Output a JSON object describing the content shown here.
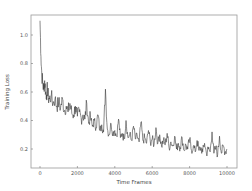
{
  "chart_data": {
    "type": "line",
    "title": "",
    "xlabel": "Time Frames",
    "ylabel": "Training Loss",
    "xlim": [
      -500,
      10500
    ],
    "ylim": [
      0.05,
      1.18
    ],
    "grid": false,
    "legend": null,
    "x_ticks": [
      0,
      2000,
      4000,
      6000,
      8000,
      10000
    ],
    "x_tick_labels": [
      "0",
      "2000",
      "4000",
      "6000",
      "8000",
      "10000"
    ],
    "y_ticks": [
      0.2,
      0.4,
      0.6,
      0.8,
      1.0
    ],
    "y_tick_labels": [
      "0.2",
      "0.4",
      "0.6",
      "0.8",
      "1.0"
    ],
    "line_color": "#3a3a3a",
    "series": [
      {
        "name": "Training Loss",
        "x": [
          0,
          50,
          100,
          150,
          200,
          250,
          300,
          350,
          400,
          450,
          500,
          600,
          700,
          800,
          900,
          1000,
          1100,
          1200,
          1300,
          1400,
          1500,
          1600,
          1700,
          1800,
          1900,
          2000,
          2100,
          2200,
          2300,
          2400,
          2500,
          2600,
          2700,
          2800,
          2900,
          3000,
          3100,
          3200,
          3300,
          3400,
          3500,
          3600,
          3700,
          3800,
          3900,
          4000,
          4100,
          4200,
          4300,
          4400,
          4500,
          4600,
          4700,
          4800,
          4900,
          5000,
          5100,
          5200,
          5300,
          5400,
          5500,
          5600,
          5700,
          5800,
          5900,
          6000,
          6100,
          6200,
          6300,
          6400,
          6500,
          6600,
          6700,
          6800,
          6900,
          7000,
          7100,
          7200,
          7300,
          7400,
          7500,
          7600,
          7700,
          7800,
          7900,
          8000,
          8100,
          8200,
          8300,
          8400,
          8500,
          8600,
          8700,
          8800,
          8900,
          9000,
          9100,
          9200,
          9300,
          9400,
          9500,
          9600,
          9700,
          9800,
          9900,
          10000
        ],
        "values": [
          1.1,
          0.85,
          0.72,
          0.66,
          0.62,
          0.68,
          0.6,
          0.58,
          0.63,
          0.56,
          0.55,
          0.57,
          0.52,
          0.55,
          0.5,
          0.53,
          0.49,
          0.55,
          0.47,
          0.5,
          0.46,
          0.52,
          0.45,
          0.44,
          0.5,
          0.43,
          0.46,
          0.42,
          0.44,
          0.41,
          0.52,
          0.38,
          0.42,
          0.36,
          0.4,
          0.35,
          0.44,
          0.33,
          0.37,
          0.32,
          0.62,
          0.34,
          0.3,
          0.38,
          0.31,
          0.33,
          0.29,
          0.41,
          0.28,
          0.31,
          0.27,
          0.4,
          0.28,
          0.3,
          0.26,
          0.36,
          0.27,
          0.29,
          0.25,
          0.39,
          0.26,
          0.28,
          0.24,
          0.33,
          0.25,
          0.27,
          0.23,
          0.35,
          0.24,
          0.3,
          0.22,
          0.26,
          0.23,
          0.31,
          0.21,
          0.25,
          0.22,
          0.29,
          0.2,
          0.24,
          0.21,
          0.28,
          0.19,
          0.23,
          0.2,
          0.27,
          0.19,
          0.22,
          0.18,
          0.26,
          0.19,
          0.21,
          0.18,
          0.24,
          0.17,
          0.2,
          0.18,
          0.32,
          0.17,
          0.21,
          0.16,
          0.29,
          0.17,
          0.22,
          0.18,
          0.2
        ]
      }
    ]
  }
}
